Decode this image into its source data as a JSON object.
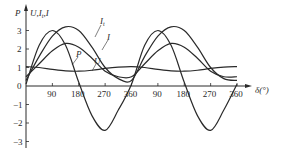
{
  "chart_data": {
    "type": "line",
    "title": "",
    "xlabel": "δ(°)",
    "ylabel_left": "P",
    "ylabel_right": "U,It,I",
    "x_ticks": [
      "90",
      "180",
      "270",
      "360",
      "90",
      "180",
      "270",
      "360"
    ],
    "y_ticks": [
      "3",
      "2",
      "1",
      "0",
      "-1",
      "-2",
      "-3"
    ],
    "xlim": [
      0,
      720
    ],
    "ylim": [
      -3,
      3.5
    ],
    "grid": false,
    "legend": "inline curve labels",
    "x": [
      0,
      45,
      90,
      135,
      180,
      225,
      270,
      315,
      360,
      405,
      450,
      495,
      540,
      585,
      630,
      675,
      720
    ],
    "series": [
      {
        "name": "P",
        "values": [
          0.1,
          2.2,
          3.0,
          2.2,
          0.2,
          -1.6,
          -2.4,
          -1.3,
          0.1,
          2.2,
          3.0,
          2.2,
          0.2,
          -1.6,
          -2.4,
          -1.3,
          0.1
        ]
      },
      {
        "name": "It",
        "values": [
          0.3,
          1.6,
          2.7,
          3.2,
          3.0,
          2.1,
          1.0,
          0.4,
          0.3,
          1.6,
          2.7,
          3.2,
          3.0,
          2.1,
          1.0,
          0.4,
          0.3
        ]
      },
      {
        "name": "I",
        "values": [
          0.5,
          1.2,
          1.9,
          2.3,
          2.1,
          1.5,
          0.8,
          0.5,
          0.5,
          1.2,
          1.9,
          2.3,
          2.1,
          1.5,
          0.8,
          0.5,
          0.5
        ]
      },
      {
        "name": "U",
        "values": [
          1.05,
          1.0,
          0.9,
          0.82,
          0.8,
          0.85,
          0.95,
          1.02,
          1.05,
          1.0,
          0.9,
          0.82,
          0.8,
          0.85,
          0.95,
          1.02,
          1.05
        ]
      }
    ],
    "curve_labels": {
      "P": "P",
      "It": "It",
      "I": "I",
      "U": "U"
    }
  },
  "axes": {
    "left_label": "P",
    "right_label": "U,I",
    "right_label_sub": "t",
    "right_label_end": ",I",
    "x_label": "δ(°)",
    "zero": "0"
  }
}
